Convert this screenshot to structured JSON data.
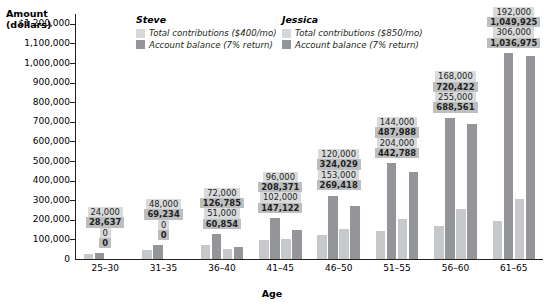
{
  "chart_data": {
    "type": "bar",
    "title": "",
    "ylabel": "Amount (dollars)",
    "xlabel": "Age",
    "ylim": [
      0,
      1250000
    ],
    "grid": false,
    "legend_position": "top",
    "categories": [
      "25–30",
      "31–35",
      "36–40",
      "41–45",
      "46–50",
      "51–55",
      "56–60",
      "61–65"
    ],
    "ytick_labels": [
      "$1,200,000",
      "1,100,000",
      "1,000,000",
      "900,000",
      "800,000",
      "700,000",
      "600,000",
      "500,000",
      "400,000",
      "300,000",
      "200,000",
      "100,000",
      "0"
    ],
    "ytick_values": [
      1200000,
      1100000,
      1000000,
      900000,
      800000,
      700000,
      600000,
      500000,
      400000,
      300000,
      200000,
      100000,
      0
    ],
    "series": [
      {
        "name": "Steve — Total contributions ($400/mo)",
        "person": "Steve",
        "kind": "contributions",
        "color": "#c6c8ca",
        "values": [
          24000,
          48000,
          72000,
          96000,
          120000,
          144000,
          168000,
          192000
        ],
        "labels": [
          "24,000",
          "48,000",
          "72,000",
          "96,000",
          "120,000",
          "144,000",
          "168,000",
          "192,000"
        ]
      },
      {
        "name": "Steve — Account balance (7% return)",
        "person": "Steve",
        "kind": "balance",
        "color": "#939598",
        "values": [
          28637,
          69234,
          126785,
          208371,
          324029,
          487988,
          720422,
          1049925
        ],
        "labels": [
          "28,637",
          "69,234",
          "126,785",
          "208,371",
          "324,029",
          "487,988",
          "720,422",
          "1,049,925"
        ]
      },
      {
        "name": "Jessica — Total contributions ($850/mo)",
        "person": "Jessica",
        "kind": "contributions",
        "color": "#c6c8ca",
        "values": [
          0,
          0,
          51000,
          102000,
          153000,
          204000,
          255000,
          306000
        ],
        "labels": [
          "0",
          "0",
          "51,000",
          "102,000",
          "153,000",
          "204,000",
          "255,000",
          "306,000"
        ]
      },
      {
        "name": "Jessica — Account balance (7% return)",
        "person": "Jessica",
        "kind": "balance",
        "color": "#939598",
        "values": [
          0,
          0,
          60854,
          147122,
          269418,
          442788,
          688561,
          1036975
        ],
        "labels": [
          "0",
          "0",
          "60,854",
          "147,122",
          "269,418",
          "442,788",
          "688,561",
          "1,036,975"
        ]
      }
    ]
  },
  "axes": {
    "y_title_line1": "Amount",
    "y_title_line2": "(dollars)",
    "x_title": "Age"
  },
  "legend": {
    "groups": [
      {
        "title": "Steve",
        "items": [
          {
            "label": "Total contributions ($400/mo)",
            "color": "#d6d7d9"
          },
          {
            "label": "Account balance (7% return)",
            "color": "#939598"
          }
        ]
      },
      {
        "title": "Jessica",
        "items": [
          {
            "label": "Total contributions ($850/mo)",
            "color": "#d6d7d9"
          },
          {
            "label": "Account balance (7% return)",
            "color": "#939598"
          }
        ]
      }
    ]
  }
}
